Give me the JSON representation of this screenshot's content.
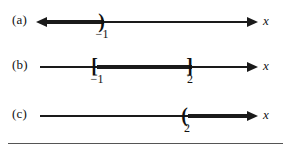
{
  "figure": {
    "background": "#ffffff",
    "ink_color": "#1a1a1a",
    "rule_color": "#555555",
    "axis_variable": "x"
  },
  "rows": [
    {
      "label": "(a)",
      "axis_name": "x",
      "description": "open ray extending left from -1",
      "endpoints": [
        {
          "value": "-1",
          "tick_label": "−1",
          "bracket": ")",
          "type": "open",
          "x": 103
        }
      ],
      "shaded": {
        "from": "-infinity",
        "to": "-1",
        "direction": "left"
      },
      "arrows": [
        "left",
        "right"
      ]
    },
    {
      "label": "(b)",
      "axis_name": "x",
      "description": "closed interval from -1 to 2",
      "endpoints": [
        {
          "value": "-1",
          "tick_label": "−1",
          "bracket": "[",
          "type": "closed",
          "x": 97
        },
        {
          "value": "2",
          "tick_label": "2",
          "bracket": "]",
          "type": "closed",
          "x": 190
        }
      ],
      "shaded": {
        "from": "-1",
        "to": "2",
        "direction": "segment"
      },
      "arrows": [
        "right"
      ]
    },
    {
      "label": "(c)",
      "axis_name": "x",
      "description": "open ray extending right from 2",
      "endpoints": [
        {
          "value": "2",
          "tick_label": "2",
          "bracket": "(",
          "type": "open",
          "x": 187
        }
      ],
      "shaded": {
        "from": "2",
        "to": "+infinity",
        "direction": "right"
      },
      "arrows": [
        "right"
      ]
    }
  ]
}
